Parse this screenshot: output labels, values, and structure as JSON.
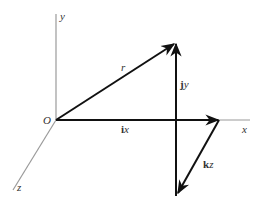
{
  "diagram": {
    "type": "3d-vector-decomposition",
    "axes": {
      "x": {
        "label": "x"
      },
      "y": {
        "label": "y"
      },
      "z": {
        "label": "z"
      },
      "origin": {
        "label": "O"
      }
    },
    "vectors": {
      "r": {
        "label": "r"
      },
      "jy": {
        "bold": "j",
        "italic": "y"
      },
      "ix": {
        "bold": "i",
        "italic": "x"
      },
      "kz": {
        "bold": "k",
        "italic": "z"
      }
    },
    "colors": {
      "axis": "#9a9a9a",
      "vector": "#111111",
      "text": "#333333"
    }
  }
}
